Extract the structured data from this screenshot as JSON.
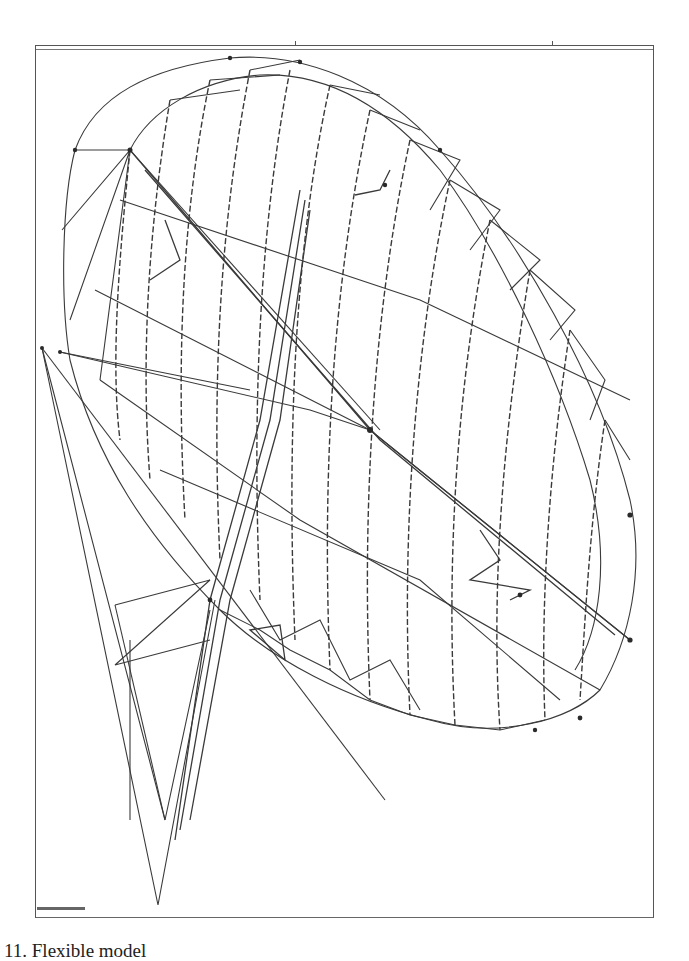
{
  "figure": {
    "caption": "11. Flexible model",
    "caption_note": "caption clipped at bottom edge",
    "corner_label": "",
    "line_color": "#3a3a3a",
    "node_color": "#2a2a2a",
    "frame_color": "#555555",
    "background": "#ffffff",
    "top_ticks_x": [
      295,
      552
    ]
  }
}
